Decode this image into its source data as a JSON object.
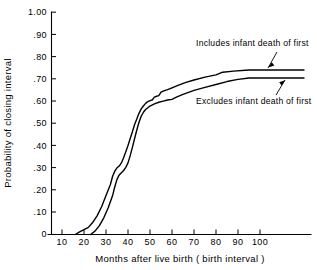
{
  "chart_data": {
    "type": "line",
    "title": "",
    "xlabel": "Months after live birth ( birth interval )",
    "ylabel": "Probability of closing interval",
    "xlim": [
      0,
      120
    ],
    "ylim": [
      0,
      1.0
    ],
    "grid": false,
    "legend_position": "inline-annotations",
    "x_ticks": [
      10,
      20,
      30,
      40,
      50,
      60,
      70,
      80,
      90,
      100
    ],
    "x_tick_labels": [
      "10",
      "20",
      "30",
      "40",
      "50",
      "60",
      "70",
      "80",
      "90",
      "100"
    ],
    "y_ticks": [
      0,
      0.1,
      0.2,
      0.3,
      0.4,
      0.5,
      0.6,
      0.7,
      0.8,
      0.9,
      1.0
    ],
    "y_tick_labels": [
      "0",
      ".10",
      ".20",
      ".30",
      ".40",
      ".50",
      ".60",
      ".70",
      ".80",
      ".90",
      "1.00"
    ],
    "series": [
      {
        "name": "Includes infant death of first",
        "points": [
          [
            16,
            0.0
          ],
          [
            18,
            0.012
          ],
          [
            20,
            0.022
          ],
          [
            22,
            0.032
          ],
          [
            24,
            0.055
          ],
          [
            26,
            0.085
          ],
          [
            28,
            0.125
          ],
          [
            30,
            0.175
          ],
          [
            32,
            0.225
          ],
          [
            33,
            0.262
          ],
          [
            34,
            0.285
          ],
          [
            35,
            0.3
          ],
          [
            36,
            0.308
          ],
          [
            37,
            0.322
          ],
          [
            38,
            0.345
          ],
          [
            39,
            0.372
          ],
          [
            40,
            0.4
          ],
          [
            41,
            0.432
          ],
          [
            42,
            0.462
          ],
          [
            43,
            0.495
          ],
          [
            44,
            0.52
          ],
          [
            45,
            0.545
          ],
          [
            46,
            0.565
          ],
          [
            47,
            0.578
          ],
          [
            48,
            0.59
          ],
          [
            49,
            0.598
          ],
          [
            50,
            0.602
          ],
          [
            51,
            0.605
          ],
          [
            52,
            0.618
          ],
          [
            53,
            0.622
          ],
          [
            54,
            0.625
          ],
          [
            55,
            0.64
          ],
          [
            56,
            0.645
          ],
          [
            58,
            0.652
          ],
          [
            60,
            0.66
          ],
          [
            63,
            0.672
          ],
          [
            66,
            0.683
          ],
          [
            70,
            0.695
          ],
          [
            75,
            0.708
          ],
          [
            80,
            0.718
          ],
          [
            83,
            0.73
          ],
          [
            88,
            0.735
          ],
          [
            95,
            0.74
          ],
          [
            100,
            0.74
          ],
          [
            120,
            0.74
          ]
        ]
      },
      {
        "name": "Excludes infant death of first",
        "points": [
          [
            23,
            0.0
          ],
          [
            25,
            0.015
          ],
          [
            27,
            0.04
          ],
          [
            29,
            0.075
          ],
          [
            31,
            0.12
          ],
          [
            33,
            0.175
          ],
          [
            34,
            0.215
          ],
          [
            35,
            0.248
          ],
          [
            36,
            0.268
          ],
          [
            37,
            0.278
          ],
          [
            38,
            0.288
          ],
          [
            39,
            0.302
          ],
          [
            40,
            0.322
          ],
          [
            41,
            0.355
          ],
          [
            42,
            0.392
          ],
          [
            43,
            0.432
          ],
          [
            44,
            0.47
          ],
          [
            45,
            0.505
          ],
          [
            46,
            0.532
          ],
          [
            47,
            0.55
          ],
          [
            48,
            0.562
          ],
          [
            49,
            0.57
          ],
          [
            50,
            0.578
          ],
          [
            52,
            0.588
          ],
          [
            54,
            0.595
          ],
          [
            56,
            0.6
          ],
          [
            58,
            0.605
          ],
          [
            60,
            0.608
          ],
          [
            62,
            0.618
          ],
          [
            65,
            0.63
          ],
          [
            70,
            0.648
          ],
          [
            75,
            0.662
          ],
          [
            80,
            0.675
          ],
          [
            85,
            0.688
          ],
          [
            90,
            0.698
          ],
          [
            95,
            0.704
          ],
          [
            100,
            0.704
          ],
          [
            120,
            0.704
          ]
        ]
      }
    ],
    "annotations": [
      {
        "text": "Includes infant death of first",
        "target_series": "Includes infant death of first",
        "target_x": 108,
        "target_y": 0.74
      },
      {
        "text": "Excludes infant death of first",
        "target_series": "Excludes infant death of first",
        "target_x": 108,
        "target_y": 0.704
      }
    ]
  }
}
